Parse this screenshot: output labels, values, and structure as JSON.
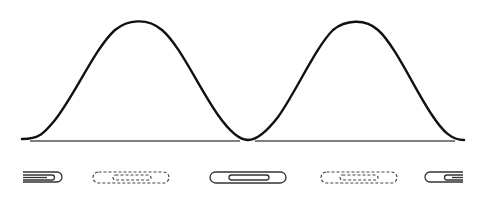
{
  "diagram": {
    "colors": {
      "curve": "#111111",
      "baseline": "#555555",
      "clip_solid": "#333333",
      "clip_dashed": "#444444",
      "background": "#ffffff"
    },
    "waves": [
      {
        "name": "wave-1",
        "start_x": 22,
        "peak_x": 137,
        "end_x": 248,
        "peak_y": 20,
        "base_y": 140
      },
      {
        "name": "wave-2",
        "start_x": 248,
        "peak_x": 355,
        "end_x": 464,
        "peak_y": 22,
        "base_y": 140
      }
    ],
    "baseline": {
      "y": 141,
      "segments": [
        [
          30,
          240
        ],
        [
          255,
          455
        ]
      ]
    },
    "clips": [
      {
        "name": "clip-1",
        "style": "solid",
        "variant": "partial-right-end",
        "x": 22,
        "y": 171
      },
      {
        "name": "clip-2",
        "style": "dashed",
        "variant": "full",
        "x": 93,
        "y": 171
      },
      {
        "name": "clip-3",
        "style": "solid",
        "variant": "full",
        "x": 210,
        "y": 171
      },
      {
        "name": "clip-4",
        "style": "dashed",
        "variant": "full",
        "x": 321,
        "y": 171
      },
      {
        "name": "clip-5",
        "style": "solid",
        "variant": "partial-left-end",
        "x": 424,
        "y": 171
      }
    ]
  }
}
